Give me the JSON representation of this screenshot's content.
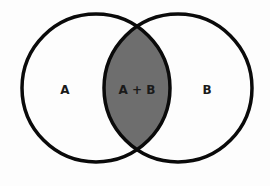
{
  "diagram": {
    "type": "venn",
    "sets": [
      {
        "id": "A",
        "label": "A",
        "cx": 96,
        "cy": 88,
        "r": 74
      },
      {
        "id": "B",
        "label": "B",
        "cx": 178,
        "cy": 88,
        "r": 74
      }
    ],
    "intersection": {
      "label": "A + B",
      "fill": "#6e6e6e"
    },
    "colors": {
      "stroke": "#0a0a0a",
      "background": "#fdfdfd"
    }
  }
}
